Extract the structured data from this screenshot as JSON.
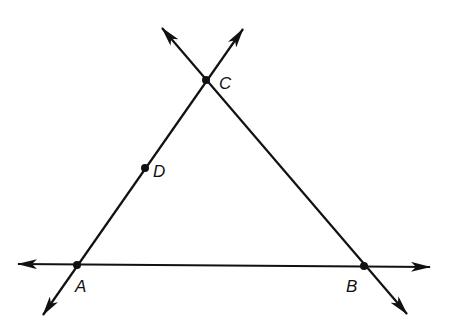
{
  "diagram": {
    "type": "geometry-triangle-lines",
    "stroke_color": "#111111",
    "background": "#ffffff",
    "points": [
      {
        "id": "A",
        "label": "A",
        "x": 77,
        "y": 265,
        "label_x": 75,
        "label_y": 292
      },
      {
        "id": "B",
        "label": "B",
        "x": 364,
        "y": 266,
        "label_x": 346,
        "label_y": 292
      },
      {
        "id": "C",
        "label": "C",
        "x": 206,
        "y": 80,
        "label_x": 219,
        "label_y": 89
      },
      {
        "id": "D",
        "label": "D",
        "x": 145,
        "y": 168,
        "label_x": 153,
        "label_y": 177
      }
    ],
    "lines": [
      {
        "id": "line-AB",
        "through": [
          "A",
          "B"
        ],
        "x1": 18,
        "y1": 264,
        "x2": 430,
        "y2": 267
      },
      {
        "id": "line-AC",
        "through": [
          "A",
          "D",
          "C"
        ],
        "x1": 43,
        "y1": 315,
        "x2": 243,
        "y2": 29
      },
      {
        "id": "line-BC",
        "through": [
          "B",
          "C"
        ],
        "x1": 162,
        "y1": 28,
        "x2": 407,
        "y2": 314
      }
    ]
  }
}
